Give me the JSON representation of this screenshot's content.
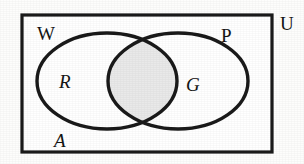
{
  "figure": {
    "kind": "venn-diagram",
    "set_count": 2,
    "universe_label": "U",
    "left_set_label": "W",
    "right_set_label": "P",
    "left_region_label": "R",
    "right_region_label": "G",
    "bottom_region_label": "A",
    "shaded_region": "intersection",
    "colors": {
      "background": "#fdfdfc",
      "stroke": "#1a1a1a",
      "shading_fill": "#e9e9e9",
      "label_text": "#141414"
    }
  }
}
